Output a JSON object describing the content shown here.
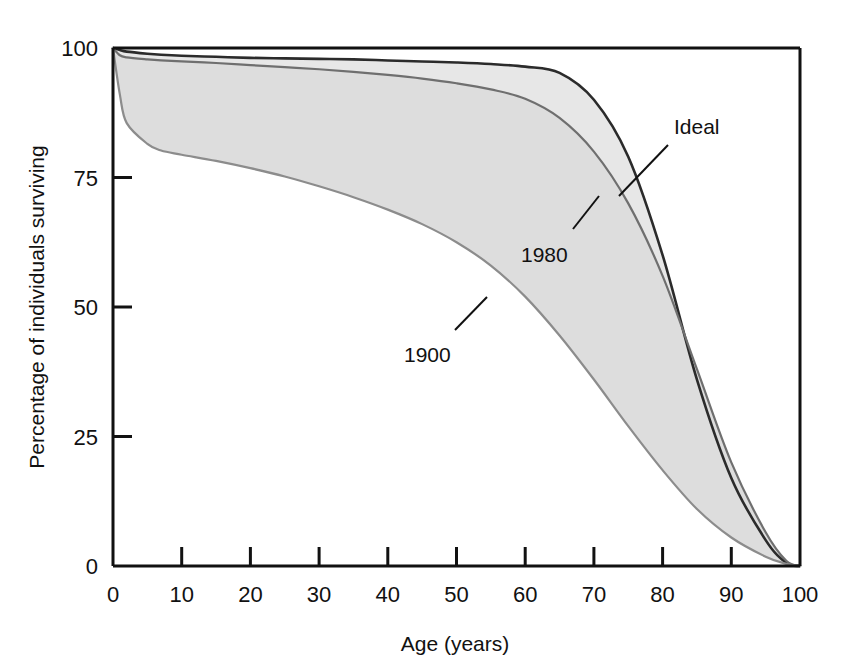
{
  "chart_data": {
    "type": "line",
    "title": "",
    "xlabel": "Age (years)",
    "ylabel": "Percentage of individuals surviving",
    "xlim": [
      0,
      100
    ],
    "ylim": [
      0,
      100
    ],
    "grid": false,
    "legend_position": "inline-annotations",
    "xticks": [
      0,
      10,
      20,
      30,
      40,
      50,
      60,
      70,
      80,
      90,
      100
    ],
    "xtick_labels": [
      "0",
      "10",
      "20",
      "30",
      "40",
      "50",
      "60",
      "70",
      "80",
      "90",
      "100"
    ],
    "yticks": [
      0,
      25,
      50,
      75,
      100
    ],
    "ytick_labels": [
      "0",
      "25",
      "50",
      "75",
      "100"
    ],
    "x": [
      0,
      1,
      2,
      5,
      7,
      10,
      15,
      20,
      25,
      30,
      35,
      40,
      45,
      50,
      55,
      60,
      65,
      70,
      75,
      80,
      85,
      90,
      95,
      98,
      100
    ],
    "series": [
      {
        "name": "Ideal",
        "label": "Ideal",
        "color": "#2b2b2b",
        "values": [
          100,
          99.6,
          99.3,
          98.9,
          98.7,
          98.5,
          98.3,
          98.1,
          98.0,
          97.9,
          97.8,
          97.6,
          97.4,
          97.2,
          96.9,
          96.4,
          95.2,
          90.0,
          79.0,
          60.0,
          36.0,
          17.0,
          5.0,
          0.6,
          0
        ]
      },
      {
        "name": "1980",
        "label": "1980",
        "color": "#6e6e6e",
        "values": [
          100,
          98.6,
          98.2,
          97.8,
          97.6,
          97.4,
          97.1,
          96.7,
          96.3,
          95.9,
          95.4,
          94.8,
          94.1,
          93.2,
          92.0,
          90.2,
          86.5,
          80.0,
          70.0,
          56.0,
          38.0,
          20.0,
          6.5,
          1.0,
          0
        ]
      },
      {
        "name": "1900",
        "label": "1900",
        "color": "#8a8a8a",
        "values": [
          100,
          91.0,
          85.5,
          81.5,
          80.2,
          79.4,
          78.2,
          76.8,
          75.2,
          73.3,
          71.2,
          68.8,
          66.0,
          62.5,
          58.0,
          52.0,
          44.5,
          36.0,
          27.0,
          18.5,
          11.0,
          5.5,
          1.8,
          0.4,
          0
        ]
      }
    ],
    "annotations": [
      {
        "text": "Ideal",
        "series": "Ideal"
      },
      {
        "text": "1980",
        "series": "1980"
      },
      {
        "text": "1900",
        "series": "1900"
      }
    ],
    "fills": [
      {
        "between": [
          "1980",
          "Ideal"
        ],
        "color": "#e6e6e6"
      },
      {
        "between": [
          "1900",
          "1980"
        ],
        "color": "#dcdcdc"
      }
    ]
  }
}
